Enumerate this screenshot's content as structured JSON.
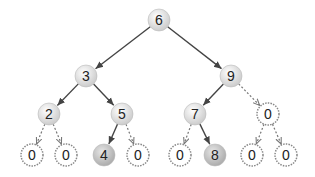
{
  "diagram": {
    "type": "binary-tree",
    "colors": {
      "edge": "#444444",
      "dashed_edge": "#777777",
      "node_fill_light": "#f2f2f2",
      "node_fill_dark": "#bdbdbd",
      "null_stroke": "#888888"
    },
    "nodes": [
      {
        "id": "n6",
        "label": "6",
        "x": 159,
        "y": 20,
        "kind": "real"
      },
      {
        "id": "n3",
        "label": "3",
        "x": 86,
        "y": 76,
        "kind": "real"
      },
      {
        "id": "n9",
        "label": "9",
        "x": 231,
        "y": 76,
        "kind": "real"
      },
      {
        "id": "n2",
        "label": "2",
        "x": 49,
        "y": 114,
        "kind": "real"
      },
      {
        "id": "n5",
        "label": "5",
        "x": 122,
        "y": 114,
        "kind": "real"
      },
      {
        "id": "n7",
        "label": "7",
        "x": 195,
        "y": 114,
        "kind": "real"
      },
      {
        "id": "n0a",
        "label": "0",
        "x": 268,
        "y": 114,
        "kind": "null"
      },
      {
        "id": "n0b",
        "label": "0",
        "x": 32,
        "y": 155,
        "kind": "null"
      },
      {
        "id": "n0c",
        "label": "0",
        "x": 66,
        "y": 155,
        "kind": "null"
      },
      {
        "id": "n4",
        "label": "4",
        "x": 104,
        "y": 155,
        "kind": "real"
      },
      {
        "id": "n0d",
        "label": "0",
        "x": 138,
        "y": 155,
        "kind": "null"
      },
      {
        "id": "n0e",
        "label": "0",
        "x": 180,
        "y": 155,
        "kind": "null"
      },
      {
        "id": "n8",
        "label": "8",
        "x": 215,
        "y": 155,
        "kind": "real"
      },
      {
        "id": "n0f",
        "label": "0",
        "x": 252,
        "y": 155,
        "kind": "null"
      },
      {
        "id": "n0g",
        "label": "0",
        "x": 286,
        "y": 155,
        "kind": "null"
      }
    ],
    "edges": [
      {
        "from": "n6",
        "to": "n3",
        "style": "solid"
      },
      {
        "from": "n6",
        "to": "n9",
        "style": "solid"
      },
      {
        "from": "n3",
        "to": "n2",
        "style": "solid"
      },
      {
        "from": "n3",
        "to": "n5",
        "style": "solid"
      },
      {
        "from": "n9",
        "to": "n7",
        "style": "solid"
      },
      {
        "from": "n9",
        "to": "n0a",
        "style": "dashed"
      },
      {
        "from": "n2",
        "to": "n0b",
        "style": "dashed"
      },
      {
        "from": "n2",
        "to": "n0c",
        "style": "dashed"
      },
      {
        "from": "n5",
        "to": "n4",
        "style": "solid"
      },
      {
        "from": "n5",
        "to": "n0d",
        "style": "dashed"
      },
      {
        "from": "n7",
        "to": "n0e",
        "style": "dashed"
      },
      {
        "from": "n7",
        "to": "n8",
        "style": "solid"
      },
      {
        "from": "n0a",
        "to": "n0f",
        "style": "dashed"
      },
      {
        "from": "n0a",
        "to": "n0g",
        "style": "dashed"
      }
    ]
  }
}
